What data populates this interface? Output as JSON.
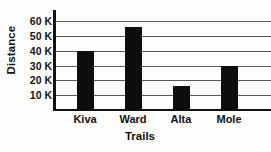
{
  "chart_data": {
    "type": "bar",
    "title": "",
    "xlabel": "Trails",
    "ylabel": "Distance",
    "categories": [
      "Kiva",
      "Ward",
      "Alta",
      "Mole"
    ],
    "values": [
      40000,
      56000,
      16000,
      30000
    ],
    "value_labels": [
      "40 K",
      "56 K",
      "16 K",
      "30 K"
    ],
    "ytick_values": [
      10000,
      20000,
      30000,
      40000,
      50000,
      60000
    ],
    "ytick_labels": [
      "10 K",
      "20 K",
      "30 K",
      "40 K",
      "50 K",
      "60 K"
    ],
    "ylim": [
      0,
      65000
    ],
    "grid": true,
    "grid_axis": "y",
    "legend": false,
    "legend_position": "none",
    "bar_color": "#0d0d0d",
    "grid_color": "#5a5a5a",
    "axis_color": "#111111",
    "background_color": "#fdfdfb"
  }
}
